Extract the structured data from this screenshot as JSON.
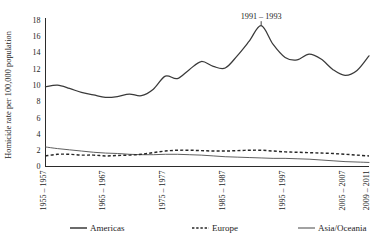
{
  "chart_data": {
    "type": "line",
    "title": "",
    "xlabel": "",
    "ylabel": "Homicide rate per 100,000 population",
    "ylim": [
      0,
      18
    ],
    "yticks": [
      0,
      2,
      4,
      6,
      8,
      10,
      12,
      14,
      16,
      18
    ],
    "ytick_labels": [
      "0",
      "2",
      "4",
      "6",
      "8",
      "10",
      "12",
      "14",
      "16",
      "18"
    ],
    "grid": false,
    "legend_position": "bottom",
    "annotations": [
      {
        "text": "1991 – 1993",
        "x_category": "1991 – 1993",
        "y_value": 17.3,
        "series": "Americas"
      }
    ],
    "x_tick_labels": [
      "1955 – 1957",
      "1965 – 1967",
      "1975 – 1977",
      "1985 – 1987",
      "1995 – 1997",
      "2005 – 2007",
      "2009 – 2011"
    ],
    "x_tick_indices": [
      0,
      5,
      10,
      15,
      20,
      25,
      27
    ],
    "categories": [
      "1955 – 1957",
      "1957 – 1959",
      "1959 – 1961",
      "1961 – 1963",
      "1963 – 1965",
      "1965 – 1967",
      "1967 – 1969",
      "1969 – 1971",
      "1971 – 1973",
      "1973 – 1975",
      "1975 – 1977",
      "1977 – 1979",
      "1979 – 1981",
      "1981 – 1983",
      "1983 – 1985",
      "1985 – 1987",
      "1987 – 1989",
      "1989 – 1991",
      "1991 – 1993",
      "1993 – 1995",
      "1995 – 1997",
      "1997 – 1999",
      "1999 – 2001",
      "2001 – 2003",
      "2003 – 2005",
      "2005 – 2007",
      "2007 – 2009",
      "2009 – 2011"
    ],
    "series": [
      {
        "name": "Americas",
        "style": "solid",
        "color": "#3a3a3a",
        "values": [
          9.8,
          10.0,
          9.6,
          9.1,
          8.8,
          8.5,
          8.6,
          8.9,
          8.7,
          9.5,
          11.1,
          10.8,
          11.9,
          12.9,
          12.3,
          12.1,
          13.6,
          15.4,
          17.3,
          15.0,
          13.4,
          13.1,
          13.8,
          13.2,
          11.9,
          11.2,
          11.8,
          13.6
        ]
      },
      {
        "name": "Europe",
        "style": "dashed",
        "color": "#262626",
        "values": [
          1.3,
          1.5,
          1.5,
          1.4,
          1.4,
          1.3,
          1.35,
          1.4,
          1.5,
          1.7,
          1.9,
          2.0,
          2.0,
          1.95,
          1.9,
          1.9,
          1.95,
          2.0,
          2.0,
          1.9,
          1.8,
          1.75,
          1.7,
          1.65,
          1.6,
          1.5,
          1.4,
          1.3
        ]
      },
      {
        "name": "Asia/Oceania",
        "style": "solid-thin",
        "color": "#565656",
        "values": [
          2.4,
          2.2,
          2.05,
          1.9,
          1.75,
          1.65,
          1.6,
          1.5,
          1.45,
          1.45,
          1.5,
          1.5,
          1.45,
          1.4,
          1.3,
          1.2,
          1.15,
          1.1,
          1.05,
          1.0,
          1.0,
          0.95,
          0.9,
          0.8,
          0.7,
          0.6,
          0.55,
          0.5
        ]
      }
    ],
    "legend": [
      {
        "label": "Americas",
        "style": "solid",
        "color": "#3a3a3a"
      },
      {
        "label": "Europe",
        "style": "dashed",
        "color": "#262626"
      },
      {
        "label": "Asia/Oceania",
        "style": "solid-thin",
        "color": "#565656"
      }
    ]
  }
}
